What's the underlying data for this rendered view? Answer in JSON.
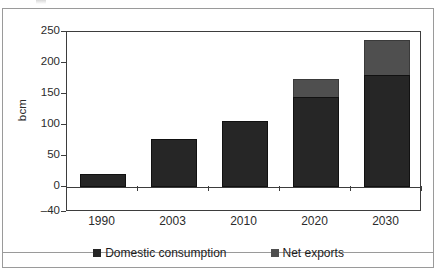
{
  "chart_data": {
    "type": "bar",
    "stacked": true,
    "title": "",
    "xlabel": "",
    "ylabel": "bcm",
    "categories": [
      "1990",
      "2003",
      "2010",
      "2020",
      "2030"
    ],
    "series": [
      {
        "name": "Domestic consumption",
        "color": "#262626",
        "values": [
          21,
          78,
          107,
          145,
          180
        ]
      },
      {
        "name": "Net exports",
        "color": "#4f4f4f",
        "values": [
          0,
          0,
          0,
          30,
          57
        ]
      }
    ],
    "totals": [
      21,
      78,
      107,
      175,
      237
    ],
    "ylim": [
      -40,
      250
    ],
    "yticks": [
      250,
      200,
      150,
      100,
      50,
      0,
      -40
    ],
    "ytick_labels": [
      "250",
      "200",
      "150",
      "100",
      "50",
      "0",
      "–40"
    ],
    "grid": false,
    "legend_position": "bottom",
    "legend": [
      "Domestic consumption",
      "Net exports"
    ]
  },
  "axis": {
    "y_title": "bcm"
  },
  "legend": {
    "items": [
      {
        "label": "Domestic consumption"
      },
      {
        "label": "Net exports"
      }
    ]
  }
}
